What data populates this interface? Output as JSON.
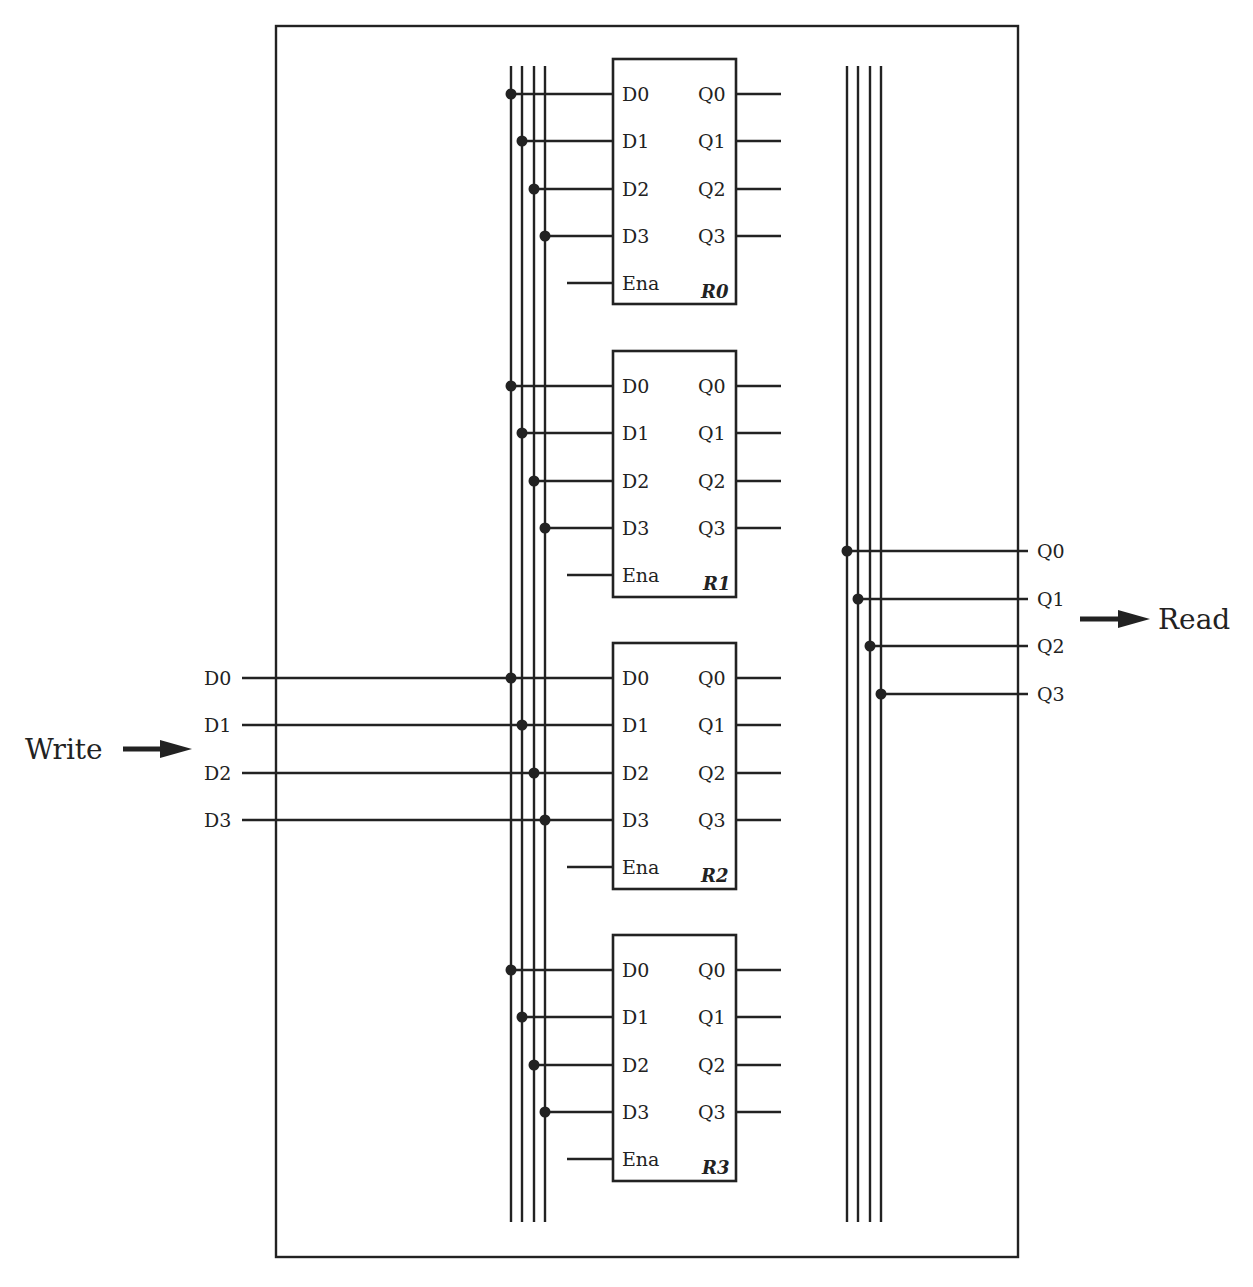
{
  "diagram": {
    "write_label": "Write",
    "read_label": "Read",
    "write_inputs": [
      "D0",
      "D1",
      "D2",
      "D3"
    ],
    "read_outputs": [
      "Q0",
      "Q1",
      "Q2",
      "Q3"
    ],
    "registers": [
      {
        "name": "R0",
        "inputs": [
          "D0",
          "D1",
          "D2",
          "D3"
        ],
        "outputs": [
          "Q0",
          "Q1",
          "Q2",
          "Q3"
        ],
        "enable": "Ena"
      },
      {
        "name": "R1",
        "inputs": [
          "D0",
          "D1",
          "D2",
          "D3"
        ],
        "outputs": [
          "Q0",
          "Q1",
          "Q2",
          "Q3"
        ],
        "enable": "Ena"
      },
      {
        "name": "R2",
        "inputs": [
          "D0",
          "D1",
          "D2",
          "D3"
        ],
        "outputs": [
          "Q0",
          "Q1",
          "Q2",
          "Q3"
        ],
        "enable": "Ena"
      },
      {
        "name": "R3",
        "inputs": [
          "D0",
          "D1",
          "D2",
          "D3"
        ],
        "outputs": [
          "Q0",
          "Q1",
          "Q2",
          "Q3"
        ],
        "enable": "Ena"
      }
    ],
    "colors": {
      "line": "#222222",
      "background": "#ffffff"
    }
  }
}
